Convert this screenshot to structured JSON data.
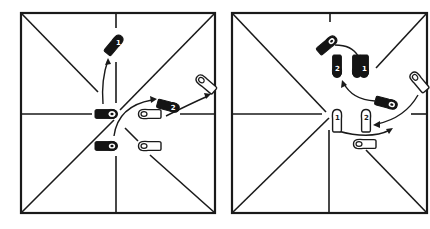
{
  "figure": {
    "panels": [
      {
        "id": "left",
        "box": {
          "x": 21,
          "y": 13,
          "w": 194,
          "h": 200
        },
        "steps": [
          {
            "foot": "dark",
            "label": "1",
            "x": 114,
            "y": 45,
            "angle": -50
          },
          {
            "foot": "dark",
            "label": "",
            "x": 106,
            "y": 114,
            "angle": 0
          },
          {
            "foot": "dark",
            "label": "",
            "x": 106,
            "y": 146,
            "angle": 0
          },
          {
            "foot": "dark",
            "label": "2",
            "x": 168,
            "y": 106,
            "angle": 15
          },
          {
            "foot": "light",
            "label": "",
            "x": 150,
            "y": 114,
            "angle": 0
          },
          {
            "foot": "light",
            "label": "",
            "x": 150,
            "y": 146,
            "angle": 0
          },
          {
            "foot": "light",
            "label": "",
            "x": 205,
            "y": 82,
            "angle": 40
          }
        ]
      },
      {
        "id": "right",
        "box": {
          "x": 232,
          "y": 13,
          "w": 195,
          "h": 200
        },
        "steps": [
          {
            "foot": "dark",
            "label": "",
            "x": 327,
            "y": 45,
            "angle": -50
          },
          {
            "foot": "dark",
            "label": "2",
            "x": 337,
            "y": 66,
            "angle": 90
          },
          {
            "foot": "dark",
            "label": "1",
            "x": 361,
            "y": 66,
            "angle": 90
          },
          {
            "foot": "dark",
            "label": "",
            "x": 385,
            "y": 104,
            "angle": 15
          },
          {
            "foot": "light",
            "label": "",
            "x": 417,
            "y": 82,
            "angle": 40
          },
          {
            "foot": "light",
            "label": "1",
            "x": 337,
            "y": 120,
            "angle": 90
          },
          {
            "foot": "light",
            "label": "2",
            "x": 366,
            "y": 120,
            "angle": 90
          },
          {
            "foot": "light",
            "label": "",
            "x": 365,
            "y": 143,
            "angle": 0
          }
        ]
      }
    ]
  }
}
